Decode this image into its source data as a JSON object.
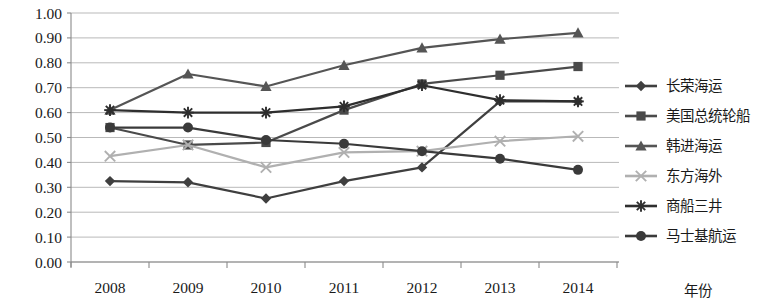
{
  "chart_data": {
    "type": "line",
    "title": "",
    "subtitle": "",
    "xlabel": "年份",
    "ylabel": "",
    "x": [
      "2008",
      "2009",
      "2010",
      "2011",
      "2012",
      "2013",
      "2014"
    ],
    "categories": [
      "2008",
      "2009",
      "2010",
      "2011",
      "2012",
      "2013",
      "2014"
    ],
    "ylim": [
      0.0,
      1.0
    ],
    "ytick_labels": [
      "0.00",
      "0.10",
      "0.20",
      "0.30",
      "0.40",
      "0.50",
      "0.60",
      "0.70",
      "0.80",
      "0.90",
      "1.00"
    ],
    "ytick_values": [
      0.0,
      0.1,
      0.2,
      0.3,
      0.4,
      0.5,
      0.6,
      0.7,
      0.8,
      0.9,
      1.0
    ],
    "grid": true,
    "grid_axis": "y",
    "legend_position": "right",
    "series": [
      {
        "name": "长荣海运",
        "marker": "diamond",
        "color": "#3f3f3f",
        "values": [
          0.325,
          0.32,
          0.255,
          0.325,
          0.38,
          0.645,
          0.645
        ]
      },
      {
        "name": "美国总统轮船",
        "marker": "square",
        "color": "#4a4a4a",
        "values": [
          0.54,
          0.47,
          0.48,
          0.61,
          0.715,
          0.75,
          0.785
        ]
      },
      {
        "name": "韩进海运",
        "marker": "triangle",
        "color": "#555555",
        "values": [
          0.61,
          0.755,
          0.705,
          0.79,
          0.86,
          0.895,
          0.92
        ]
      },
      {
        "name": "东方海外",
        "marker": "x",
        "color": "#b0b0b0",
        "values": [
          0.425,
          0.47,
          0.38,
          0.44,
          0.445,
          0.485,
          0.505
        ]
      },
      {
        "name": "商船三井",
        "marker": "asterisk",
        "color": "#2e2e2e",
        "values": [
          0.61,
          0.6,
          0.6,
          0.625,
          0.71,
          0.65,
          0.645
        ]
      },
      {
        "name": "马士基航运",
        "marker": "circle",
        "color": "#3a3a3a",
        "values": [
          0.54,
          0.54,
          0.49,
          0.475,
          0.445,
          0.415,
          0.37
        ]
      }
    ]
  },
  "axis": {
    "x_title": "年份"
  }
}
